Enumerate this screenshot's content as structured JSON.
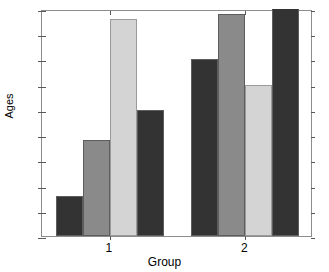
{
  "chart_data": {
    "type": "bar",
    "title": "",
    "xlabel": "Group",
    "ylabel": "Ages",
    "categories": [
      "1",
      "2"
    ],
    "ylim": [
      0,
      45
    ],
    "yticks": [
      0,
      5,
      10,
      15,
      20,
      25,
      30,
      35,
      40,
      45
    ],
    "ytick_labels": [
      "0",
      "5",
      "10",
      "15",
      "20",
      "25",
      "30",
      "35",
      "40",
      "45"
    ],
    "grid": false,
    "legend": "none",
    "series": [
      {
        "name": "Series 1",
        "color": "#333333",
        "values": [
          8,
          35
        ]
      },
      {
        "name": "Series 2",
        "color": "#8a8a8a",
        "values": [
          19,
          44
        ]
      },
      {
        "name": "Series 3",
        "color": "#d4d4d4",
        "values": [
          43,
          30
        ]
      },
      {
        "name": "Series 4",
        "color": "#333333",
        "values": [
          25,
          45
        ]
      }
    ],
    "bars": [
      {
        "group": "1",
        "series": "Series 1",
        "value": 8,
        "color": "#333333"
      },
      {
        "group": "1",
        "series": "Series 2",
        "value": 19,
        "color": "#8a8a8a"
      },
      {
        "group": "1",
        "series": "Series 3",
        "value": 43,
        "color": "#d4d4d4"
      },
      {
        "group": "1",
        "series": "Series 4",
        "value": 25,
        "color": "#333333"
      },
      {
        "group": "2",
        "series": "Series 1",
        "value": 35,
        "color": "#333333"
      },
      {
        "group": "2",
        "series": "Series 2",
        "value": 44,
        "color": "#8a8a8a"
      },
      {
        "group": "2",
        "series": "Series 3",
        "value": 30,
        "color": "#d4d4d4"
      },
      {
        "group": "2",
        "series": "Series 4",
        "value": 45,
        "color": "#333333"
      }
    ]
  },
  "axes": {
    "background": "#ffffff",
    "line_color": "#8d8d8d",
    "tick_color": "#5a5a5a"
  }
}
